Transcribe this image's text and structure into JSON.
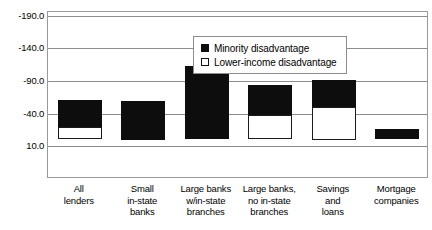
{
  "chart_data": {
    "type": "bar",
    "title": "",
    "subtitle": "",
    "xlabel": "",
    "ylabel": "",
    "stacked": true,
    "grid": true,
    "legend_position": "inside-top-center",
    "y_axis_inverted": true,
    "ylim": [
      -190.0,
      10.0
    ],
    "y_ticks": [
      "-190.0",
      "-140.0",
      "-90.0",
      "-40.0",
      "10.0"
    ],
    "y_tick_values": [
      -190.0,
      -140.0,
      -90.0,
      -40.0,
      10.0
    ],
    "categories": [
      "All lenders",
      "Small in-state banks",
      "Large banks w/in-state branches",
      "Large banks, no in-state branches",
      "Savings and loans",
      "Mortgage companies"
    ],
    "category_label_lines": [
      [
        "All",
        "lenders"
      ],
      [
        "Small",
        "in-state",
        "banks"
      ],
      [
        "Large banks",
        "w/in-state",
        "branches"
      ],
      [
        "Large banks,",
        "no in-state",
        "branches"
      ],
      [
        "Savings",
        "and",
        "loans"
      ],
      [
        "Mortgage",
        "companies"
      ]
    ],
    "series": [
      {
        "name": "Minority disadvantage",
        "color": "#0d0d0d",
        "style": "filled",
        "values": [
          -61,
          -60,
          -113,
          -84,
          -91,
          -16
        ]
      },
      {
        "name": "Lower-income disadvantage",
        "color": "#ffffff",
        "style": "open",
        "values": [
          -19,
          0,
          0,
          -37,
          -50,
          0
        ]
      }
    ]
  },
  "legend": {
    "items": [
      {
        "label": "Minority disadvantage",
        "swatch": "filled-square-icon"
      },
      {
        "label": "Lower-income disadvantage",
        "swatch": "open-square-icon"
      }
    ]
  }
}
